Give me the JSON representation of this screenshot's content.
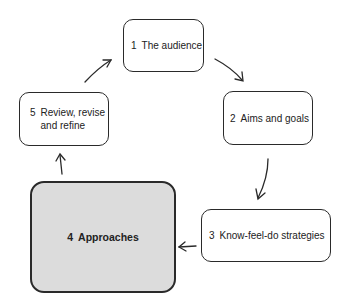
{
  "diagram": {
    "type": "cycle",
    "steps": [
      {
        "number": "1",
        "label": "The audience"
      },
      {
        "number": "2",
        "label": "Aims and goals"
      },
      {
        "number": "3",
        "label": "Know-feel-do strategies"
      },
      {
        "number": "4",
        "label": "Approaches",
        "highlighted": true
      },
      {
        "number": "5",
        "label_line1": "Review, revise",
        "label_line2": "and refine"
      }
    ],
    "edges": [
      {
        "from": "1",
        "to": "2"
      },
      {
        "from": "2",
        "to": "3"
      },
      {
        "from": "3",
        "to": "4"
      },
      {
        "from": "4",
        "to": "5"
      },
      {
        "from": "5",
        "to": "1"
      }
    ],
    "colors": {
      "border": "#2a2a2a",
      "highlight_fill": "#dcdcdc",
      "background": "#ffffff"
    }
  }
}
